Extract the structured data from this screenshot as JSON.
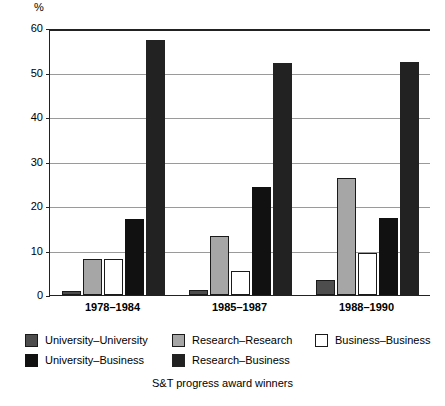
{
  "chart_data": {
    "type": "bar",
    "title": "",
    "subtitle": "",
    "caption": "S&T progress award winners",
    "xlabel": "",
    "ylabel": "%",
    "ylim": [
      0,
      60
    ],
    "yticks": [
      0,
      10,
      20,
      30,
      40,
      50,
      60
    ],
    "ytick_labels": [
      "0",
      "10",
      "20",
      "30",
      "40",
      "50",
      "60"
    ],
    "grid": true,
    "legend_position": "bottom",
    "categories": [
      "1978–1984",
      "1985–1987",
      "1988–1990"
    ],
    "series": [
      {
        "name": "University–University",
        "color": "#4d4d4d",
        "border": "#1a1a1a",
        "values": [
          1.0,
          1.2,
          3.4
        ]
      },
      {
        "name": "Research–Research",
        "color": "#a6a6a6",
        "border": "#1a1a1a",
        "values": [
          8.1,
          13.3,
          26.2
        ]
      },
      {
        "name": "Business–Business",
        "color": "#ffffff",
        "border": "#1a1a1a",
        "values": [
          8.1,
          5.3,
          9.4
        ]
      },
      {
        "name": "University–Business",
        "color": "#111111",
        "border": "#111111",
        "values": [
          17.0,
          24.2,
          17.3
        ]
      },
      {
        "name": "Research–Business",
        "color": "#222222",
        "border": "#222222",
        "values": [
          57.2,
          52.2,
          52.3
        ]
      }
    ]
  },
  "axis": {
    "unit_label": "%"
  },
  "legend": {
    "rows": [
      [
        {
          "label": "University–University",
          "swatch": "#4d4d4d",
          "border": "#1a1a1a"
        },
        {
          "label": "Research–Research",
          "swatch": "#a6a6a6",
          "border": "#1a1a1a"
        },
        {
          "label": "Business–Business",
          "swatch": "#ffffff",
          "border": "#1a1a1a"
        }
      ],
      [
        {
          "label": "University–Business",
          "swatch": "#111111",
          "border": "#111111"
        },
        {
          "label": "Research–Business",
          "swatch": "#222222",
          "border": "#222222"
        }
      ]
    ]
  }
}
